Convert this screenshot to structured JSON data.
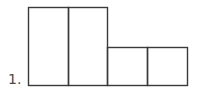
{
  "problem": {
    "number_label": "1."
  },
  "figure": {
    "stroke_color": "#3a3a3a",
    "tall_rectangles": 2,
    "short_squares": 2
  }
}
